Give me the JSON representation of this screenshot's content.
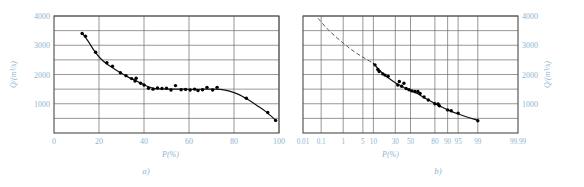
{
  "figure": {
    "panels": [
      {
        "id": "a",
        "caption": "a)",
        "xlabel": "P(%)",
        "ylabel": "Q/(m³/s)"
      },
      {
        "id": "b",
        "caption": "b)",
        "xlabel": "P(%)",
        "ylabel": "Q/(m³/s)"
      }
    ]
  },
  "colors": {
    "axis_text": "#8fb4d0",
    "frame": "#4a4a4a",
    "grid": "#6b6b6b",
    "curve": "#111111",
    "marker": "#000000",
    "dashed": "#555555",
    "background": "#ffffff"
  },
  "chart_data": [
    {
      "type": "scatter",
      "id": "panel-a",
      "title": "",
      "xlabel": "P(%)",
      "ylabel": "Q/(m³/s)",
      "xlim": [
        0,
        100
      ],
      "ylim": [
        0,
        4000
      ],
      "xticks": [
        0,
        20,
        40,
        60,
        80,
        100
      ],
      "xticklabels": [
        "0",
        "20",
        "40",
        "60",
        "80",
        "100"
      ],
      "yticks": [
        0,
        500,
        1000,
        1500,
        2000,
        2500,
        3000,
        3500,
        4000
      ],
      "yticklabels": [
        "",
        "",
        "1000",
        "",
        "2000",
        "",
        "3000",
        "",
        "4000"
      ],
      "grid": true,
      "x_axis_scale": "linear",
      "legend": "none",
      "points": [
        {
          "x": 12.5,
          "y": 3400
        },
        {
          "x": 14.0,
          "y": 3310
        },
        {
          "x": 18.5,
          "y": 2760
        },
        {
          "x": 23.5,
          "y": 2400
        },
        {
          "x": 26.0,
          "y": 2280
        },
        {
          "x": 29.5,
          "y": 2060
        },
        {
          "x": 32.0,
          "y": 1960
        },
        {
          "x": 34.5,
          "y": 1860
        },
        {
          "x": 36.0,
          "y": 1780
        },
        {
          "x": 36.5,
          "y": 1870
        },
        {
          "x": 38.5,
          "y": 1700
        },
        {
          "x": 40.0,
          "y": 1640
        },
        {
          "x": 42.0,
          "y": 1530
        },
        {
          "x": 44.0,
          "y": 1500
        },
        {
          "x": 46.0,
          "y": 1540
        },
        {
          "x": 48.0,
          "y": 1520
        },
        {
          "x": 50.0,
          "y": 1530
        },
        {
          "x": 52.0,
          "y": 1470
        },
        {
          "x": 54.0,
          "y": 1620
        },
        {
          "x": 56.5,
          "y": 1480
        },
        {
          "x": 58.5,
          "y": 1490
        },
        {
          "x": 60.5,
          "y": 1470
        },
        {
          "x": 62.5,
          "y": 1500
        },
        {
          "x": 64.0,
          "y": 1450
        },
        {
          "x": 66.0,
          "y": 1480
        },
        {
          "x": 68.0,
          "y": 1560
        },
        {
          "x": 70.5,
          "y": 1470
        },
        {
          "x": 72.5,
          "y": 1560
        },
        {
          "x": 85.5,
          "y": 1190
        },
        {
          "x": 95.0,
          "y": 700
        },
        {
          "x": 98.5,
          "y": 430
        }
      ],
      "curve": [
        {
          "x": 12.5,
          "y": 3420
        },
        {
          "x": 15.0,
          "y": 3160
        },
        {
          "x": 18.0,
          "y": 2800
        },
        {
          "x": 21.0,
          "y": 2520
        },
        {
          "x": 24.0,
          "y": 2330
        },
        {
          "x": 27.0,
          "y": 2180
        },
        {
          "x": 30.0,
          "y": 2040
        },
        {
          "x": 33.0,
          "y": 1910
        },
        {
          "x": 36.0,
          "y": 1800
        },
        {
          "x": 39.0,
          "y": 1690
        },
        {
          "x": 42.0,
          "y": 1580
        },
        {
          "x": 45.0,
          "y": 1520
        },
        {
          "x": 48.0,
          "y": 1505
        },
        {
          "x": 52.0,
          "y": 1500
        },
        {
          "x": 56.0,
          "y": 1500
        },
        {
          "x": 60.0,
          "y": 1495
        },
        {
          "x": 65.0,
          "y": 1495
        },
        {
          "x": 70.0,
          "y": 1500
        },
        {
          "x": 74.0,
          "y": 1490
        },
        {
          "x": 78.0,
          "y": 1430
        },
        {
          "x": 82.0,
          "y": 1320
        },
        {
          "x": 86.0,
          "y": 1150
        },
        {
          "x": 90.0,
          "y": 950
        },
        {
          "x": 94.0,
          "y": 740
        },
        {
          "x": 98.5,
          "y": 440
        }
      ]
    },
    {
      "type": "scatter",
      "id": "panel-b",
      "title": "",
      "xlabel": "P(%)",
      "ylabel": "Q/(m³/s)",
      "x_axis_scale": "probability",
      "xticks": [
        0.01,
        0.1,
        1,
        5,
        10,
        30,
        50,
        80,
        90,
        95,
        99,
        99.99
      ],
      "xticklabels": [
        "0.01",
        "0.1",
        "1",
        "5",
        "10",
        "30",
        "50",
        "80",
        "90",
        "95",
        "99",
        "99.99"
      ],
      "ylim": [
        0,
        4000
      ],
      "yticks": [
        0,
        500,
        1000,
        1500,
        2000,
        2500,
        3000,
        3500,
        4000
      ],
      "yticklabels": [
        "",
        "",
        "1000",
        "",
        "2000",
        "",
        "3000",
        "",
        "4000"
      ],
      "grid": true,
      "y_axis_side": "right",
      "legend": "none",
      "dashed_extension": true,
      "points": [
        {
          "x": 11.0,
          "y": 2330
        },
        {
          "x": 13.0,
          "y": 2170
        },
        {
          "x": 14.0,
          "y": 2100
        },
        {
          "x": 17.0,
          "y": 2020
        },
        {
          "x": 19.0,
          "y": 1980
        },
        {
          "x": 22.0,
          "y": 1940
        },
        {
          "x": 33.0,
          "y": 1640
        },
        {
          "x": 35.0,
          "y": 1760
        },
        {
          "x": 38.0,
          "y": 1600
        },
        {
          "x": 41.0,
          "y": 1700
        },
        {
          "x": 44.0,
          "y": 1520
        },
        {
          "x": 48.0,
          "y": 1480
        },
        {
          "x": 52.0,
          "y": 1440
        },
        {
          "x": 56.0,
          "y": 1420
        },
        {
          "x": 60.0,
          "y": 1420
        },
        {
          "x": 63.0,
          "y": 1350
        },
        {
          "x": 68.0,
          "y": 1230
        },
        {
          "x": 73.0,
          "y": 1130
        },
        {
          "x": 80.0,
          "y": 1000
        },
        {
          "x": 83.0,
          "y": 990
        },
        {
          "x": 84.0,
          "y": 930
        },
        {
          "x": 90.0,
          "y": 790
        },
        {
          "x": 92.0,
          "y": 760
        },
        {
          "x": 95.0,
          "y": 680
        },
        {
          "x": 99.0,
          "y": 420
        }
      ],
      "curve": [
        {
          "x": 10.0,
          "y": 2380
        },
        {
          "x": 15.0,
          "y": 2110
        },
        {
          "x": 20.0,
          "y": 1940
        },
        {
          "x": 25.0,
          "y": 1820
        },
        {
          "x": 30.0,
          "y": 1720
        },
        {
          "x": 35.0,
          "y": 1640
        },
        {
          "x": 40.0,
          "y": 1570
        },
        {
          "x": 45.0,
          "y": 1500
        },
        {
          "x": 50.0,
          "y": 1450
        },
        {
          "x": 55.0,
          "y": 1400
        },
        {
          "x": 60.0,
          "y": 1340
        },
        {
          "x": 65.0,
          "y": 1260
        },
        {
          "x": 70.0,
          "y": 1180
        },
        {
          "x": 75.0,
          "y": 1100
        },
        {
          "x": 80.0,
          "y": 1010
        },
        {
          "x": 85.0,
          "y": 910
        },
        {
          "x": 90.0,
          "y": 790
        },
        {
          "x": 95.0,
          "y": 650
        },
        {
          "x": 99.0,
          "y": 430
        }
      ],
      "dashed_curve": [
        {
          "x": 0.07,
          "y": 3920
        },
        {
          "x": 0.2,
          "y": 3560
        },
        {
          "x": 0.6,
          "y": 3230
        },
        {
          "x": 1.5,
          "y": 2950
        },
        {
          "x": 3.0,
          "y": 2740
        },
        {
          "x": 6.0,
          "y": 2540
        },
        {
          "x": 10.0,
          "y": 2380
        }
      ]
    }
  ]
}
